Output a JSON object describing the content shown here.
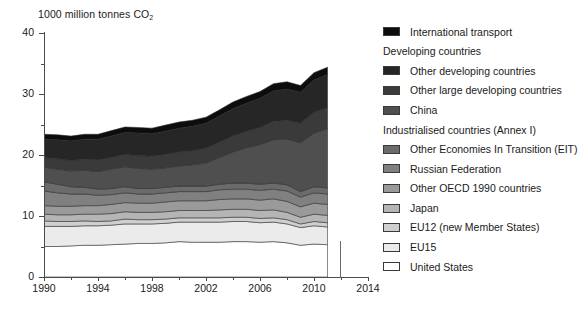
{
  "chart_data": {
    "type": "area",
    "title": "1000 million tonnes CO2",
    "ylabel": "1000 million tonnes CO₂",
    "xlabel": "",
    "stacked": true,
    "grid": false,
    "legend_position": "right",
    "xlim": [
      1990,
      2014
    ],
    "ylim": [
      0,
      40
    ],
    "y_ticks": [
      0,
      10,
      20,
      30,
      40
    ],
    "y_minor_ticks": [
      5,
      15,
      25,
      35
    ],
    "x_ticks": [
      1990,
      1994,
      1998,
      2002,
      2006,
      2010,
      2014
    ],
    "x_minor_ticks": [
      1992,
      1996,
      2000,
      2004,
      2008,
      2012
    ],
    "x": [
      1990,
      1991,
      1992,
      1993,
      1994,
      1995,
      1996,
      1997,
      1998,
      1999,
      2000,
      2001,
      2002,
      2003,
      2004,
      2005,
      2006,
      2007,
      2008,
      2009,
      2010,
      2011
    ],
    "series": [
      {
        "name": "United States",
        "color": "#ffffff",
        "values": [
          5.0,
          5.0,
          5.1,
          5.2,
          5.2,
          5.3,
          5.4,
          5.5,
          5.5,
          5.6,
          5.8,
          5.7,
          5.7,
          5.7,
          5.8,
          5.8,
          5.7,
          5.8,
          5.6,
          5.2,
          5.4,
          5.3
        ]
      },
      {
        "name": "EU15",
        "color": "#ebebeb",
        "values": [
          3.3,
          3.3,
          3.2,
          3.2,
          3.2,
          3.2,
          3.3,
          3.2,
          3.2,
          3.2,
          3.2,
          3.3,
          3.3,
          3.3,
          3.3,
          3.3,
          3.2,
          3.2,
          3.1,
          2.9,
          3.0,
          2.9
        ]
      },
      {
        "name": "EU12 (new Member States)",
        "color": "#cfcfcf",
        "values": [
          0.9,
          0.8,
          0.8,
          0.8,
          0.7,
          0.7,
          0.8,
          0.7,
          0.7,
          0.7,
          0.7,
          0.7,
          0.7,
          0.7,
          0.7,
          0.7,
          0.7,
          0.7,
          0.7,
          0.6,
          0.7,
          0.7
        ]
      },
      {
        "name": "Japan",
        "color": "#b5b5b5",
        "values": [
          1.1,
          1.1,
          1.1,
          1.1,
          1.2,
          1.2,
          1.2,
          1.2,
          1.2,
          1.2,
          1.2,
          1.2,
          1.2,
          1.3,
          1.3,
          1.3,
          1.3,
          1.3,
          1.2,
          1.1,
          1.2,
          1.2
        ]
      },
      {
        "name": "Other OECD 1990 countries",
        "color": "#9a9a9a",
        "values": [
          1.4,
          1.4,
          1.4,
          1.4,
          1.4,
          1.5,
          1.5,
          1.5,
          1.5,
          1.6,
          1.6,
          1.6,
          1.6,
          1.7,
          1.7,
          1.7,
          1.7,
          1.8,
          1.8,
          1.7,
          1.8,
          1.8
        ]
      },
      {
        "name": "Russian Federation",
        "color": "#808080",
        "values": [
          2.4,
          2.2,
          2.0,
          1.9,
          1.7,
          1.6,
          1.6,
          1.5,
          1.5,
          1.5,
          1.5,
          1.5,
          1.5,
          1.6,
          1.6,
          1.6,
          1.6,
          1.6,
          1.7,
          1.6,
          1.7,
          1.7
        ]
      },
      {
        "name": "Other Economies In Transition (EIT)",
        "color": "#6b6b6b",
        "values": [
          1.5,
          1.4,
          1.2,
          1.1,
          1.0,
          1.0,
          1.0,
          0.9,
          0.9,
          0.9,
          0.9,
          0.9,
          0.9,
          0.9,
          1.0,
          1.0,
          1.0,
          1.0,
          1.0,
          0.9,
          1.0,
          1.0
        ]
      },
      {
        "name": "China",
        "color": "#4f4f4f",
        "values": [
          2.4,
          2.5,
          2.6,
          2.8,
          2.9,
          3.2,
          3.3,
          3.3,
          3.2,
          3.2,
          3.3,
          3.5,
          3.8,
          4.4,
          5.1,
          5.8,
          6.5,
          7.1,
          7.5,
          8.0,
          8.8,
          9.7
        ]
      },
      {
        "name": "Other large developing countries",
        "color": "#3a3a3a",
        "values": [
          1.6,
          1.7,
          1.7,
          1.8,
          1.9,
          1.9,
          2.0,
          2.1,
          2.1,
          2.2,
          2.3,
          2.3,
          2.4,
          2.5,
          2.6,
          2.7,
          2.8,
          3.0,
          3.1,
          3.2,
          3.4,
          3.5
        ]
      },
      {
        "name": "Other developing countries",
        "color": "#262626",
        "values": [
          3.0,
          3.1,
          3.2,
          3.3,
          3.4,
          3.5,
          3.6,
          3.7,
          3.7,
          3.8,
          3.9,
          4.0,
          4.1,
          4.3,
          4.5,
          4.6,
          4.8,
          5.0,
          5.1,
          5.1,
          5.3,
          5.4
        ]
      },
      {
        "name": "International transport",
        "color": "#0d0d0d",
        "values": [
          0.8,
          0.8,
          0.8,
          0.8,
          0.8,
          0.9,
          0.9,
          0.9,
          0.9,
          1.0,
          1.0,
          1.0,
          1.0,
          1.0,
          1.1,
          1.1,
          1.1,
          1.2,
          1.2,
          1.1,
          1.2,
          1.2
        ]
      }
    ],
    "totals": [
      23.4,
      23.3,
      23.1,
      23.4,
      23.4,
      24.0,
      24.6,
      24.5,
      24.4,
      24.9,
      25.4,
      25.7,
      26.2,
      27.4,
      28.7,
      29.6,
      30.4,
      31.7,
      32.0,
      31.4,
      33.5,
      34.4
    ]
  },
  "axes": {
    "y_title_main": "1000 million tonnes CO",
    "y_title_sub": "2",
    "y_tick_labels": [
      "0",
      "10",
      "20",
      "30",
      "40"
    ],
    "x_tick_labels": [
      "1990",
      "1994",
      "1998",
      "2002",
      "2006",
      "2010",
      "2014"
    ]
  },
  "legend": {
    "entries": [
      {
        "kind": "item",
        "label": "International transport",
        "color": "#0d0d0d"
      },
      {
        "kind": "group",
        "label": "Developing countries",
        "color": null
      },
      {
        "kind": "item",
        "label": "Other developing countries",
        "color": "#262626"
      },
      {
        "kind": "item",
        "label": "Other large developing countries",
        "color": "#3a3a3a"
      },
      {
        "kind": "item",
        "label": "China",
        "color": "#4f4f4f"
      },
      {
        "kind": "group",
        "label": "Industrialised countries (Annex I)",
        "color": null
      },
      {
        "kind": "item",
        "label": "Other Economies In Transition (EIT)",
        "color": "#6b6b6b"
      },
      {
        "kind": "item",
        "label": "Russian Federation",
        "color": "#808080"
      },
      {
        "kind": "item",
        "label": "Other OECD 1990 countries",
        "color": "#9a9a9a"
      },
      {
        "kind": "item",
        "label": "Japan",
        "color": "#b5b5b5"
      },
      {
        "kind": "item",
        "label": "EU12 (new Member States)",
        "color": "#cfcfcf"
      },
      {
        "kind": "item",
        "label": "EU15",
        "color": "#ebebeb"
      },
      {
        "kind": "item",
        "label": "United States",
        "color": "#ffffff"
      }
    ]
  },
  "colors": {
    "axis": "#4a4a4a",
    "text": "#1a1a1a",
    "background": "#ffffff",
    "marker_line": "#6a6a6a",
    "band_outline": "#2b2b2b"
  }
}
